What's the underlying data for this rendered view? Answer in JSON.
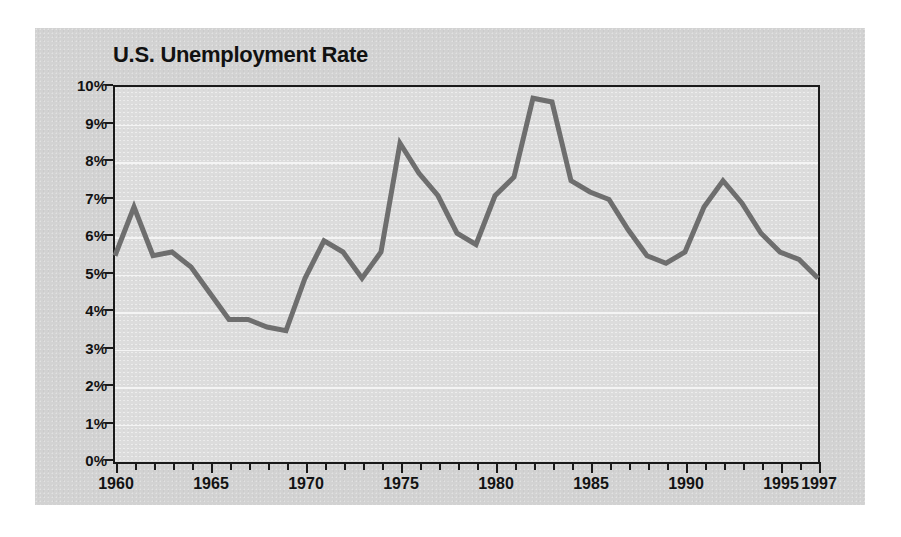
{
  "figure": {
    "background_color": "#ffffff",
    "panel_color": "#d2d2d2",
    "plot_color": "#dcdcdc",
    "axis_color": "#1a1a1a",
    "line_color": "#6e6e6e",
    "gridline_color": "#f4f4f4"
  },
  "chart_data": {
    "type": "line",
    "title": "U.S. Unemployment Rate",
    "xlabel": "",
    "ylabel": "",
    "xlim": [
      1960,
      1997
    ],
    "ylim": [
      0,
      10
    ],
    "grid": true,
    "legend": null,
    "y_tick_labels": [
      "0%",
      "1%",
      "2%",
      "3%",
      "4%",
      "5%",
      "6%",
      "7%",
      "8%",
      "9%",
      "10%"
    ],
    "y_tick_values": [
      0,
      1,
      2,
      3,
      4,
      5,
      6,
      7,
      8,
      9,
      10
    ],
    "x_tick_labels": [
      "1960",
      "1965",
      "1970",
      "1975",
      "1980",
      "1985",
      "1990",
      "1995",
      "1997"
    ],
    "x_tick_values": [
      1960,
      1965,
      1970,
      1975,
      1980,
      1985,
      1990,
      1995,
      1997
    ],
    "x_minor_step": 1,
    "series": [
      {
        "name": "U.S. Unemployment Rate",
        "color": "#6e6e6e",
        "x": [
          1960,
          1961,
          1962,
          1963,
          1964,
          1965,
          1966,
          1967,
          1968,
          1969,
          1970,
          1971,
          1972,
          1973,
          1974,
          1975,
          1976,
          1977,
          1978,
          1979,
          1980,
          1981,
          1982,
          1983,
          1984,
          1985,
          1986,
          1987,
          1988,
          1989,
          1990,
          1991,
          1992,
          1993,
          1994,
          1995,
          1996,
          1997
        ],
        "values": [
          5.5,
          6.8,
          5.5,
          5.6,
          5.2,
          4.5,
          3.8,
          3.8,
          3.6,
          3.5,
          4.9,
          5.9,
          5.6,
          4.9,
          5.6,
          8.5,
          7.7,
          7.1,
          6.1,
          5.8,
          7.1,
          7.6,
          9.7,
          9.6,
          7.5,
          7.2,
          7.0,
          6.2,
          5.5,
          5.3,
          5.6,
          6.8,
          7.5,
          6.9,
          6.1,
          5.6,
          5.4,
          4.9
        ]
      }
    ]
  }
}
